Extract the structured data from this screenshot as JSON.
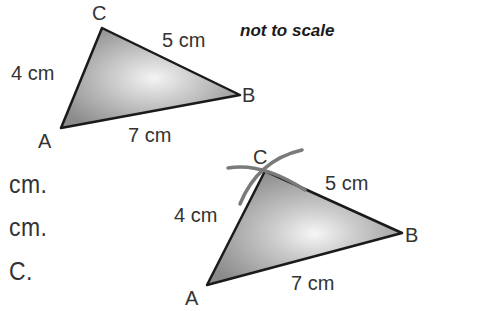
{
  "note": "not to scale",
  "text_fragments": [
    "cm.",
    "cm.",
    "C."
  ],
  "triangle1": {
    "vertices": {
      "A": "A",
      "B": "B",
      "C": "C"
    },
    "sides": {
      "AC": "4 cm",
      "CB": "5 cm",
      "AB": "7 cm"
    }
  },
  "triangle2": {
    "vertices": {
      "A": "A",
      "B": "B",
      "C": "C"
    },
    "sides": {
      "AC": "4 cm",
      "CB": "5 cm",
      "AB": "7 cm"
    },
    "construction_arcs": 2
  },
  "colors": {
    "fill_edge": "#8a8a8a",
    "fill_center": "#f2f2f2",
    "stroke": "#1a1a1a",
    "arc": "#7a7a7a"
  }
}
